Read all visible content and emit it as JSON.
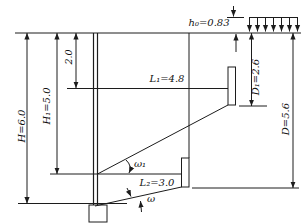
{
  "figure": {
    "background_color": "#ffffff",
    "ink_color": "#1c1c1c",
    "surcharge": {
      "equivalent_height_label": "h₀=0.83",
      "equivalent_height_value": 0.83,
      "load_arrows_count": 7
    },
    "dimensions": {
      "H": {
        "label": "H=6.0",
        "value": 6.0
      },
      "H1": {
        "label": "H₁=5.0",
        "value": 5.0
      },
      "tie_depth": {
        "label": "2.0",
        "value": 2.0
      },
      "L1": {
        "label": "L₁=4.8",
        "value": 4.8
      },
      "L2": {
        "label": "L₂=3.0",
        "value": 3.0
      },
      "D1": {
        "label": "D₁=2.6",
        "value": 2.6
      },
      "D": {
        "label": "D=5.6",
        "value": 5.6
      }
    },
    "angles": {
      "omega1": {
        "label": "ω₁"
      },
      "omega": {
        "label": "ω"
      }
    }
  }
}
